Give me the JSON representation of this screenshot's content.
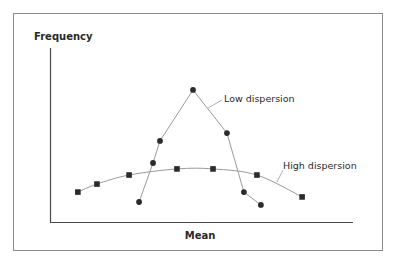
{
  "chart_data": {
    "type": "line",
    "title": "",
    "xlabel": "Mean",
    "ylabel": "Frequency",
    "grid": false,
    "legend_position": "none",
    "axis_ranges": {
      "x": [
        0,
        100
      ],
      "y": [
        0,
        100
      ]
    },
    "note": "Conceptual diagram without numeric ticks; values are positions normalized to 0-100 of the plot area.",
    "series": [
      {
        "name": "Low dispersion",
        "marker": "circle",
        "points": [
          {
            "x": 29.4,
            "y": 11.5
          },
          {
            "x": 34.0,
            "y": 33.9
          },
          {
            "x": 36.3,
            "y": 46.6
          },
          {
            "x": 47.2,
            "y": 75.9
          },
          {
            "x": 58.4,
            "y": 51.1
          },
          {
            "x": 64.0,
            "y": 17.2
          },
          {
            "x": 69.6,
            "y": 9.8
          }
        ]
      },
      {
        "name": "High dispersion",
        "marker": "square",
        "points": [
          {
            "x": 9.2,
            "y": 17.2
          },
          {
            "x": 15.5,
            "y": 21.8
          },
          {
            "x": 26.1,
            "y": 27.0
          },
          {
            "x": 41.9,
            "y": 30.5
          },
          {
            "x": 53.8,
            "y": 30.5
          },
          {
            "x": 68.3,
            "y": 27.0
          },
          {
            "x": 83.2,
            "y": 14.4
          }
        ]
      }
    ],
    "annotations": [
      {
        "text": "Low dispersion",
        "target_series": "Low dispersion"
      },
      {
        "text": "High dispersion",
        "target_series": "High dispersion"
      }
    ]
  },
  "labels": {
    "y_axis": "Frequency",
    "x_axis": "Mean",
    "low": "Low dispersion",
    "high": "High dispersion"
  },
  "colors": {
    "frame": "#8a8a8a",
    "axis": "#4a4a4a",
    "line": "#9a9a9a",
    "marker": "#2b2b2b",
    "text": "#2a2a2a"
  }
}
